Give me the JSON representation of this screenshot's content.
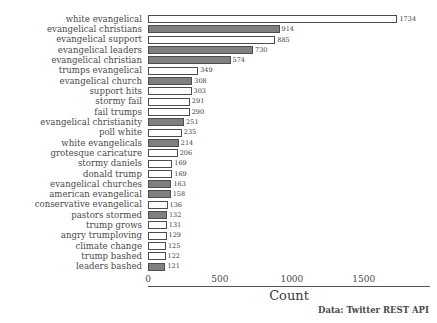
{
  "chart_data": {
    "type": "bar",
    "orientation": "horizontal",
    "title": "",
    "xlabel": "Count",
    "ylabel": "",
    "xlim": [
      0,
      1960
    ],
    "xticks": [
      0,
      500,
      1000,
      1500
    ],
    "xtick_labels": [
      "0",
      "500",
      "1000",
      "1500"
    ],
    "grid": false,
    "legend": null,
    "annotation": "Data: Twitter REST API",
    "categories": [
      "white evangelical",
      "evangelical christians",
      "evangelical support",
      "evangelical leaders",
      "evangelical christian",
      "trumps evangelical",
      "evangelical church",
      "support hits",
      "stormy fail",
      "fail trumps",
      "evangelical christianity",
      "poll white",
      "white evangelicals",
      "grotesque caricature",
      "stormy daniels",
      "donald trump",
      "evangelical churches",
      "american evangelical",
      "conservative evangelical",
      "pastors stormed",
      "trump grows",
      "angry trumploving",
      "climate change",
      "trump bashed",
      "leaders bashed"
    ],
    "values": [
      1734,
      914,
      885,
      730,
      574,
      349,
      308,
      303,
      291,
      290,
      251,
      235,
      214,
      206,
      169,
      169,
      163,
      158,
      136,
      132,
      131,
      129,
      125,
      122,
      121
    ],
    "bar_fills": [
      "white",
      "gray",
      "white",
      "gray",
      "gray",
      "white",
      "gray",
      "white",
      "white",
      "white",
      "gray",
      "white",
      "gray",
      "white",
      "white",
      "white",
      "gray",
      "gray",
      "white",
      "gray",
      "white",
      "white",
      "white",
      "white",
      "gray"
    ]
  },
  "colors": {
    "bar_fill_gray": "#808080",
    "bar_fill_white": "#ffffff",
    "bar_edge": "#4d4d4d",
    "text": "#4a4a4a",
    "background": "#ffffff"
  }
}
